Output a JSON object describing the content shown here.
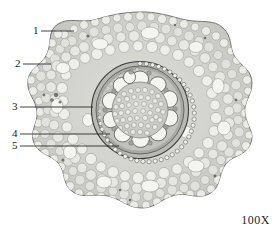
{
  "figure": {
    "magnification": "100X",
    "specimen_type": "root-cross-section"
  },
  "callouts": [
    {
      "id": "1",
      "label": "1",
      "x": 33,
      "y": 26,
      "line_x1": 41,
      "line_x2": 74,
      "line_y": 31
    },
    {
      "id": "2",
      "label": "2",
      "x": 15,
      "y": 59,
      "line_x1": 23,
      "line_x2": 51,
      "line_y": 64
    },
    {
      "id": "3",
      "label": "3",
      "x": 12,
      "y": 102,
      "line_x1": 20,
      "line_x2": 93,
      "line_y": 107
    },
    {
      "id": "4",
      "label": "4",
      "x": 12,
      "y": 129,
      "line_x1": 20,
      "line_x2": 110,
      "line_y": 134
    },
    {
      "id": "5",
      "label": "5",
      "x": 12,
      "y": 141,
      "line_x1": 20,
      "line_x2": 119,
      "line_y": 146
    }
  ],
  "anatomy": {
    "outline_region": "epidermis-cortex-boundary",
    "cortex_region": "cortex-parenchyma",
    "stele_region": "stele",
    "vessel_count": 11,
    "pith_region": "pith"
  },
  "colors": {
    "ink": "#2b2b2b",
    "tissue_light": "#e8e8e6",
    "tissue_mid": "#bdbdba",
    "tissue_dark": "#6e6e6c",
    "lumen": "#f2f2ef",
    "background": "#ffffff"
  }
}
